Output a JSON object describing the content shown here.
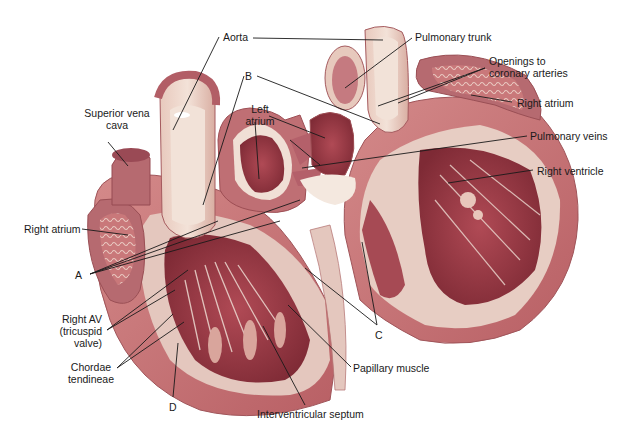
{
  "diagram": {
    "palette": {
      "muscle": "#c9787a",
      "muscle_dark": "#a84a52",
      "chamber": "#9c3b46",
      "vessel_wall": "#e9d2c6",
      "vessel_inner": "#e6c0b4",
      "endocardium": "#efe4da",
      "leader_line": "#1a1a1a",
      "text": "#1a1a1a",
      "background": "#ffffff"
    },
    "labels": {
      "aorta": "Aorta",
      "pulmonary_trunk": "Pulmonary trunk",
      "openings_coronary_1": "Openings to",
      "openings_coronary_2": "coronary arteries",
      "right_atrium_right": "Right atrium",
      "pulmonary_veins": "Pulmonary veins",
      "right_ventricle": "Right ventricle",
      "superior_vena_cava_1": "Superior vena",
      "superior_vena_cava_2": "cava",
      "b": "B",
      "left_atrium_1": "Left",
      "left_atrium_2": "atrium",
      "right_atrium_left": "Right atrium",
      "a": "A",
      "right_av_1": "Right AV",
      "right_av_2": "(tricuspid",
      "right_av_3": "valve)",
      "chordae_1": "Chordae",
      "chordae_2": "tendineae",
      "d": "D",
      "interventricular_septum": "Interventricular septum",
      "papillary_muscle": "Papillary muscle",
      "c": "C"
    }
  }
}
